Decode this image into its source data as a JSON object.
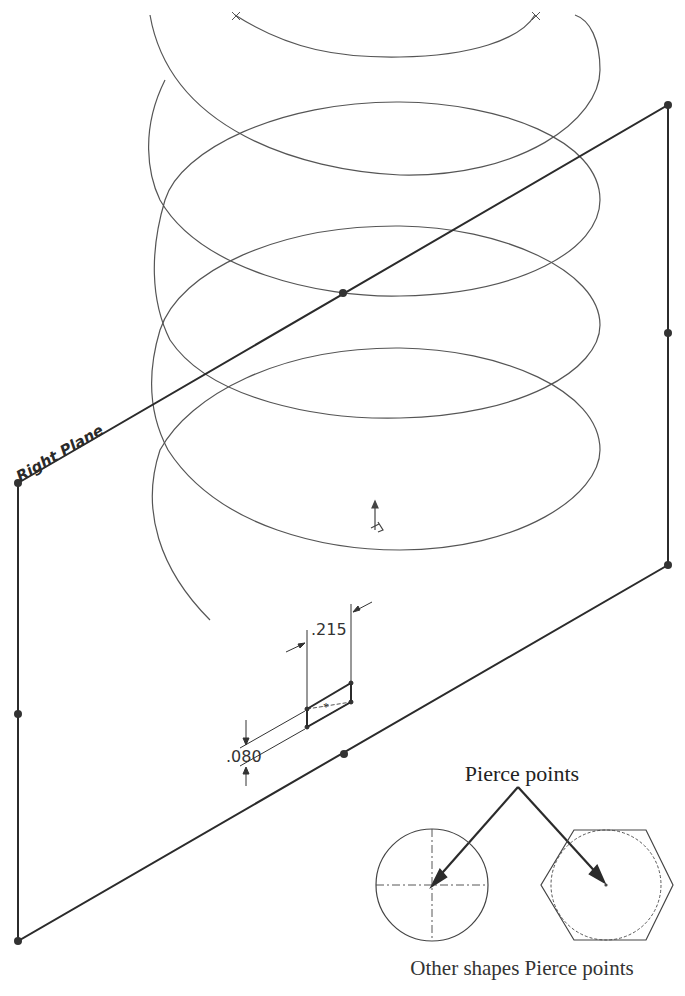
{
  "diagram": {
    "plane": {
      "label": "Right Plane",
      "corners": {
        "top_left": [
          18,
          483
        ],
        "top_right": [
          668,
          105
        ],
        "bottom_right": [
          668,
          565
        ],
        "bottom_left": [
          18,
          941
        ]
      },
      "edge_midpoints": [
        [
          343,
          293
        ],
        [
          668,
          333
        ],
        [
          344,
          754
        ],
        [
          18,
          714
        ]
      ]
    },
    "helix": {
      "center_x": 375,
      "radius_x": 225,
      "turns_visible": 4
    },
    "profile_sketch": {
      "width_dimension": ".215",
      "height_dimension": ".080"
    },
    "callout": {
      "title": "Pierce points",
      "caption": "Other shapes Pierce points",
      "shapes": [
        "circle",
        "hexagon"
      ]
    },
    "colors": {
      "line": "#2b2b2b",
      "thin_line": "#555555",
      "background": "#ffffff"
    }
  }
}
